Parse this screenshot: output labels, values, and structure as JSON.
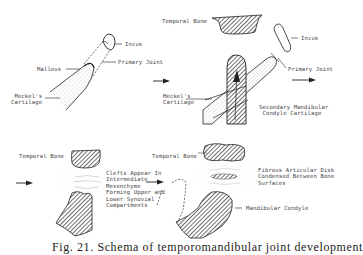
{
  "figure": {
    "caption": "Fig. 21. Schema of temporomandibular joint development",
    "colors": {
      "line": "#222222",
      "label": "#444444",
      "stipple": "#9a9a9a",
      "background": "#ffffff"
    },
    "panels": [
      {
        "id": "stage-1",
        "position": "top-left",
        "labels": {
          "incus": "Incus",
          "primary_joint": "Primary Joint",
          "malleus": "Malleus",
          "meckels_cartilage": "Meckel's\nCartilage"
        }
      },
      {
        "id": "stage-2",
        "position": "top-right",
        "labels": {
          "temporal_bone": "Temporal Bone",
          "incus": "Incus",
          "primary_joint": "Primary Joint",
          "meckels_cartilage": "Meckel's\nCartilage",
          "secondary_cartilage": "Secondary Mandibular\n Condyle Cartilage"
        }
      },
      {
        "id": "stage-3",
        "position": "bottom-left",
        "labels": {
          "temporal_bone": "Temporal Bone",
          "clefts": "Clefts Appear In\nIntermediate\nMesenchyme\nForming Upper and\nLower Synovial\nCompartments"
        }
      },
      {
        "id": "stage-4",
        "position": "bottom-right",
        "labels": {
          "temporal_bone": "Temporal Bone",
          "disk": "Fibrous Articular Disk\nCondensed Between Bone\nSurfaces",
          "condyle": "Mandibular Condyle"
        }
      }
    ]
  }
}
